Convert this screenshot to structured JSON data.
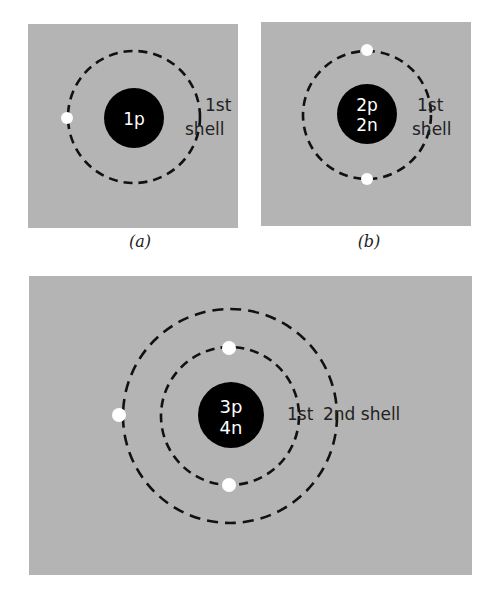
{
  "figure": {
    "background": "#ffffff",
    "panel_color": "#b4b4b4",
    "nucleus_color": "#000000",
    "electron_color": "#ffffff",
    "orbit_color": "#111111",
    "panels": [
      {
        "id": "a",
        "caption": "(a)",
        "nucleus": {
          "lines": [
            "1p"
          ]
        },
        "shells": [
          {
            "label_line1": "1st",
            "label_line2": "shell",
            "electrons": 1
          }
        ]
      },
      {
        "id": "b",
        "caption": "(b)",
        "nucleus": {
          "lines": [
            "2p",
            "2n"
          ]
        },
        "shells": [
          {
            "label_line1": "1st",
            "label_line2": "shell",
            "electrons": 2
          }
        ]
      },
      {
        "id": "c",
        "caption": "",
        "nucleus": {
          "lines": [
            "3p",
            "4n"
          ]
        },
        "shells": [
          {
            "label": "1st",
            "electrons": 2
          },
          {
            "label": "2nd shell",
            "electrons": 1
          }
        ]
      }
    ]
  }
}
